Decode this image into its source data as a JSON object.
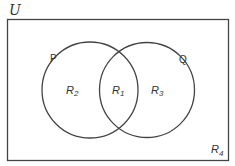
{
  "diagram": {
    "type": "venn",
    "universe_label": "U",
    "sets": [
      {
        "name": "P",
        "label": "P"
      },
      {
        "name": "Q",
        "label": "Q"
      }
    ],
    "regions": [
      {
        "id": "R1",
        "letter": "R",
        "sub": "1",
        "description": "P ∩ Q"
      },
      {
        "id": "R2",
        "letter": "R",
        "sub": "2",
        "description": "P only"
      },
      {
        "id": "R3",
        "letter": "R",
        "sub": "3",
        "description": "Q only"
      },
      {
        "id": "R4",
        "letter": "R",
        "sub": "4",
        "description": "outside P and Q"
      }
    ],
    "colors": {
      "stroke": "#444444",
      "background": "#ffffff"
    }
  }
}
